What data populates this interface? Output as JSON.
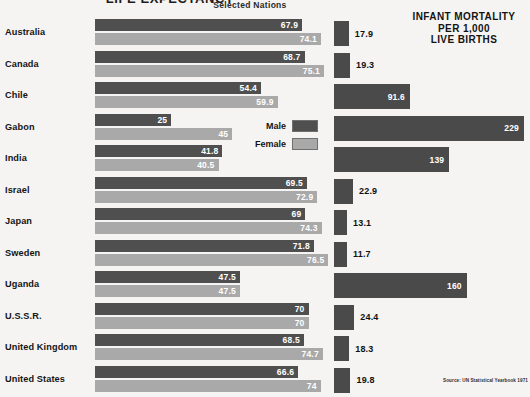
{
  "titles": {
    "main": "LIFE EXPECTANCY",
    "sub": "Selected Nations",
    "right_line1": "INFANT MORTALITY",
    "right_line2": "PER 1,000",
    "right_line3": "LIVE BIRTHS"
  },
  "legend": {
    "male_label": "Male",
    "female_label": "Female",
    "male_color": "#4f4f4f",
    "female_color": "#a9a9a9"
  },
  "source": "Source: UN Statistical Yearbook 1971",
  "chart_data": {
    "type": "bar",
    "title": "LIFE EXPECTANCY",
    "subtitle": "Selected Nations",
    "orientation": "horizontal",
    "grid": false,
    "legend_position": "center",
    "panels": [
      {
        "name": "life-expectancy",
        "title": "LIFE EXPECTANCY",
        "subtitle": "Selected Nations",
        "unit": "years",
        "xlim": [
          0,
          80
        ],
        "series": [
          {
            "name": "Male",
            "color": "#4f4f4f",
            "values": [
              67.9,
              68.7,
              54.4,
              25,
              41.8,
              69.5,
              69,
              71.8,
              47.5,
              70,
              68.5,
              66.6
            ]
          },
          {
            "name": "Female",
            "color": "#a9a9a9",
            "values": [
              74.1,
              75.1,
              59.9,
              45,
              40.5,
              72.9,
              74.3,
              76.5,
              47.5,
              70,
              74.7,
              74
            ]
          }
        ]
      },
      {
        "name": "infant-mortality",
        "title": "INFANT MORTALITY PER 1,000 LIVE BIRTHS",
        "unit": "deaths per 1,000 live births",
        "xlim": [
          0,
          240
        ],
        "color": "#4a4a4a",
        "values": [
          17.9,
          19.3,
          91.6,
          229,
          139,
          22.9,
          13.1,
          11.7,
          160,
          24.4,
          18.3,
          19.8
        ]
      }
    ],
    "categories": [
      "Australia",
      "Canada",
      "Chile",
      "Gabon",
      "India",
      "Israel",
      "Japan",
      "Sweden",
      "Uganda",
      "U.S.S.R.",
      "United Kingdom",
      "United States"
    ],
    "rows": [
      {
        "country": "Australia",
        "male": "67.9",
        "female": "74.1",
        "male_n": 67.9,
        "female_n": 74.1,
        "infant": "17.9",
        "infant_n": 17.9
      },
      {
        "country": "Canada",
        "male": "68.7",
        "female": "75.1",
        "male_n": 68.7,
        "female_n": 75.1,
        "infant": "19.3",
        "infant_n": 19.3
      },
      {
        "country": "Chile",
        "male": "54.4",
        "female": "59.9",
        "male_n": 54.4,
        "female_n": 59.9,
        "infant": "91.6",
        "infant_n": 91.6
      },
      {
        "country": "Gabon",
        "male": "25",
        "female": "45",
        "male_n": 25.0,
        "female_n": 45.0,
        "infant": "229",
        "infant_n": 229
      },
      {
        "country": "India",
        "male": "41.8",
        "female": "40.5",
        "male_n": 41.8,
        "female_n": 40.5,
        "infant": "139",
        "infant_n": 139
      },
      {
        "country": "Israel",
        "male": "69.5",
        "female": "72.9",
        "male_n": 69.5,
        "female_n": 72.9,
        "infant": "22.9",
        "infant_n": 22.9
      },
      {
        "country": "Japan",
        "male": "69",
        "female": "74.3",
        "male_n": 69.0,
        "female_n": 74.3,
        "infant": "13.1",
        "infant_n": 13.1
      },
      {
        "country": "Sweden",
        "male": "71.8",
        "female": "76.5",
        "male_n": 71.8,
        "female_n": 76.5,
        "infant": "11.7",
        "infant_n": 11.7
      },
      {
        "country": "Uganda",
        "male": "47.5",
        "female": "47.5",
        "male_n": 47.5,
        "female_n": 47.5,
        "infant": "160",
        "infant_n": 160
      },
      {
        "country": "U.S.S.R.",
        "male": "70",
        "female": "70",
        "male_n": 70.0,
        "female_n": 70.0,
        "infant": "24.4",
        "infant_n": 24.4
      },
      {
        "country": "United Kingdom",
        "male": "68.5",
        "female": "74.7",
        "male_n": 68.5,
        "female_n": 74.7,
        "infant": "18.3",
        "infant_n": 18.3
      },
      {
        "country": "United States",
        "male": "66.6",
        "female": "74",
        "male_n": 66.6,
        "female_n": 74.0,
        "infant": "19.8",
        "infant_n": 19.8
      }
    ]
  }
}
